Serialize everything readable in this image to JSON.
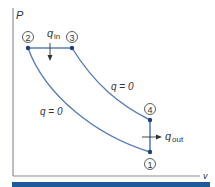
{
  "diagram": {
    "axes": {
      "y_label": "P",
      "x_label": "v"
    },
    "states": [
      {
        "id": "1",
        "label": "1"
      },
      {
        "id": "2",
        "label": "2"
      },
      {
        "id": "3",
        "label": "3"
      },
      {
        "id": "4",
        "label": "4"
      }
    ],
    "processes": [
      {
        "from": "1",
        "to": "2",
        "label": "q = 0"
      },
      {
        "from": "2",
        "to": "3",
        "label": "q_in"
      },
      {
        "from": "3",
        "to": "4",
        "label": "q = 0"
      },
      {
        "from": "4",
        "to": "1",
        "label": "q_out"
      }
    ],
    "labels": {
      "q_in_main": "q",
      "q_in_sub": "in",
      "q_out_main": "q",
      "q_out_sub": "out",
      "adiabatic_compression": "q = 0",
      "adiabatic_expansion": "q = 0"
    },
    "colors": {
      "curve": "#5b7fb5",
      "point": "#1f3f7a",
      "axis": "#7a7a8a",
      "bottom_bar": "#1d5a9a",
      "text": "#333333"
    }
  }
}
